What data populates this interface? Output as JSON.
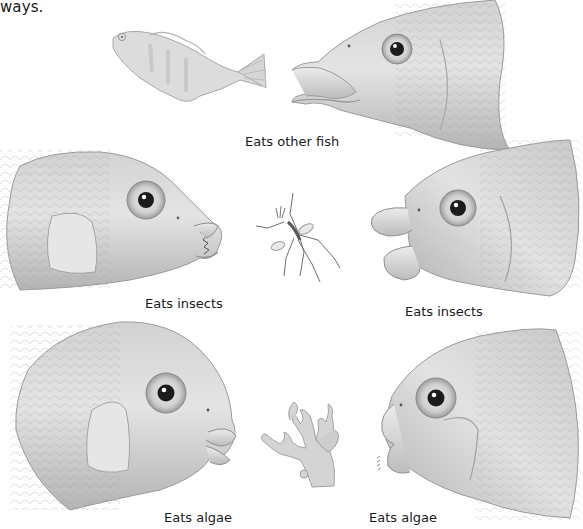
{
  "intro_text_fragment": "ways.",
  "figure": {
    "top": {
      "prey": {
        "name": "small fish",
        "icon": "small-fish-icon"
      },
      "predator": {
        "name": "fish head with long protruding jaws",
        "icon": "fish-head-icon"
      },
      "label": "Eats other fish"
    },
    "middle": {
      "center_food": {
        "name": "insect",
        "icon": "insect-icon"
      },
      "left": {
        "name": "fish head with sharp teeth",
        "icon": "fish-head-icon",
        "label": "Eats insects"
      },
      "right": {
        "name": "fish head with thick lips",
        "icon": "fish-head-icon",
        "label": "Eats insects"
      }
    },
    "bottom": {
      "center_food": {
        "name": "algae",
        "icon": "algae-icon"
      },
      "left": {
        "name": "fish head with scraping lips",
        "icon": "fish-head-icon",
        "label": "Eats algae"
      },
      "right": {
        "name": "fish head with comb-like teeth",
        "icon": "fish-head-icon",
        "label": "Eats algae"
      }
    }
  },
  "colors": {
    "background": "#ffffff",
    "text": "#1a1a1a",
    "fish_light": "#e6e6e6",
    "fish_mid": "#bdbdbd",
    "fish_dark": "#8a8a8a",
    "eye": "#1c1c1c"
  }
}
